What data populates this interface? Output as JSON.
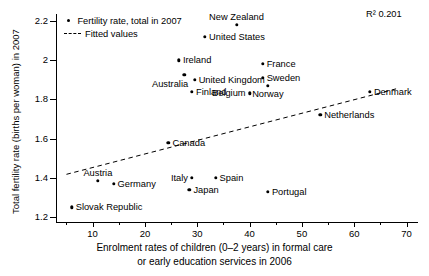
{
  "chart_data": {
    "type": "scatter",
    "title": "",
    "xlabel": "Enrolment rates of children (0–2 years) in formal care or early education services in 2006",
    "xlabel_line1": "Enrolment rates of children (0–2 years) in formal care",
    "xlabel_line2": "or early education services in 2006",
    "ylabel": "Total fertility rate (births per woman) in 2007",
    "xlim": [
      3.0,
      72.0
    ],
    "ylim": [
      1.175,
      2.235
    ],
    "xticks": [
      10,
      20,
      30,
      40,
      50,
      60,
      70
    ],
    "xtick_labels": [
      "10",
      "20",
      "30",
      "40",
      "50",
      "60",
      "70"
    ],
    "xticks_minor": [
      5,
      15,
      25,
      35,
      45,
      55,
      65
    ],
    "yticks": [
      1.2,
      1.4,
      1.6,
      1.8,
      2.0,
      2.2
    ],
    "ytick_labels": [
      "1.2",
      "1.4",
      "1.6",
      "1.8",
      "2",
      "2.2"
    ],
    "grid": false,
    "annotation_r2": "R² 0.201",
    "legend": {
      "position": "top-left-inside",
      "entries": [
        {
          "marker": "dot",
          "label": "Fertility rate, total in 2007"
        },
        {
          "marker": "dashed-line",
          "label": "Fitted values"
        }
      ]
    },
    "series": [
      {
        "name": "Fertility rate, total in 2007",
        "points": [
          {
            "label": "New Zealand",
            "x": 37.5,
            "y": 2.18,
            "label_pos": "above"
          },
          {
            "label": "United States",
            "x": 31.5,
            "y": 2.12,
            "label_pos": "right"
          },
          {
            "label": "Ireland",
            "x": 26.5,
            "y": 2.0,
            "label_pos": "right"
          },
          {
            "label": "United Kingdom",
            "x": 29.5,
            "y": 1.9,
            "label_pos": "right"
          },
          {
            "label": "Australia",
            "x": 27.5,
            "y": 1.925,
            "label_pos": "below-left"
          },
          {
            "label": "Finland",
            "x": 29.0,
            "y": 1.84,
            "label_pos": "right"
          },
          {
            "label": "France",
            "x": 42.5,
            "y": 1.98,
            "label_pos": "right"
          },
          {
            "label": "Sweden",
            "x": 42.5,
            "y": 1.91,
            "label_pos": "right"
          },
          {
            "label": "Norway",
            "x": 43.5,
            "y": 1.87,
            "label_pos": "below"
          },
          {
            "label": "Belgium",
            "x": 40.0,
            "y": 1.83,
            "label_pos": "left"
          },
          {
            "label": "Denmark",
            "x": 63.0,
            "y": 1.84,
            "label_pos": "right"
          },
          {
            "label": "Netherlands",
            "x": 53.5,
            "y": 1.72,
            "label_pos": "right"
          },
          {
            "label": "Canada",
            "x": 24.5,
            "y": 1.58,
            "label_pos": "right"
          },
          {
            "label": "Austria",
            "x": 11.0,
            "y": 1.385,
            "label_pos": "above"
          },
          {
            "label": "Germany",
            "x": 14.0,
            "y": 1.37,
            "label_pos": "right"
          },
          {
            "label": "Italy",
            "x": 29.0,
            "y": 1.4,
            "label_pos": "left"
          },
          {
            "label": "Japan",
            "x": 28.5,
            "y": 1.34,
            "label_pos": "right"
          },
          {
            "label": "Spain",
            "x": 33.5,
            "y": 1.4,
            "label_pos": "right"
          },
          {
            "label": "Portugal",
            "x": 43.5,
            "y": 1.33,
            "label_pos": "right"
          },
          {
            "label": "Slovak Republic",
            "x": 6.0,
            "y": 1.25,
            "label_pos": "right"
          }
        ]
      },
      {
        "name": "Fitted values",
        "type": "line",
        "style": "dashed",
        "endpoints": [
          {
            "x": 5.0,
            "y": 1.418
          },
          {
            "x": 68.5,
            "y": 1.857
          }
        ]
      }
    ]
  }
}
